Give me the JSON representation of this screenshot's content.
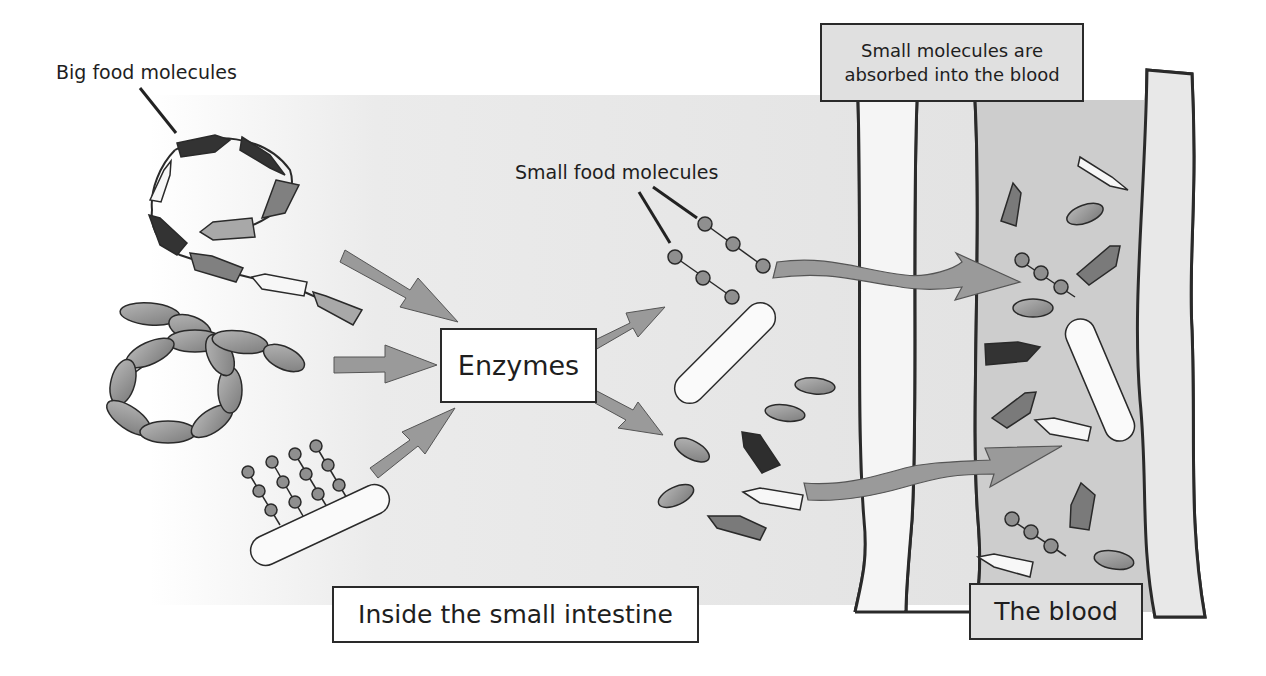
{
  "diagram": {
    "topic": "Digestion and absorption in the small intestine",
    "labels": {
      "big_food_molecules": "Big food molecules",
      "small_food_molecules": "Small food molecules",
      "enzymes": "Enzymes",
      "absorbed_line1": "Small molecules are",
      "absorbed_line2": "absorbed into the blood",
      "inside_small_intestine": "Inside the small intestine",
      "the_blood": "The blood"
    },
    "colors": {
      "background": "#ffffff",
      "intestine_shade": "#e6e6e6",
      "blood_shade": "#cfcfcf",
      "arrow_fill": "#9a9a9a",
      "outline": "#2a2a2a",
      "dark_segment": "#333333",
      "mid_segment": "#808080",
      "light_segment": "#a8a8a8",
      "white_segment": "#f7f7f7",
      "callout_box_fill": "#e0e0e0"
    },
    "molecule_types": [
      "protein-chain (pentagon segments)",
      "starch-chain (oval beads)",
      "fat (glycerol bar with fatty-acid bead chains)"
    ],
    "flow": [
      "Big food molecules -> Enzymes",
      "Enzymes -> Small food molecules",
      "Small food molecules -> absorbed through intestine wall into the blood"
    ]
  }
}
